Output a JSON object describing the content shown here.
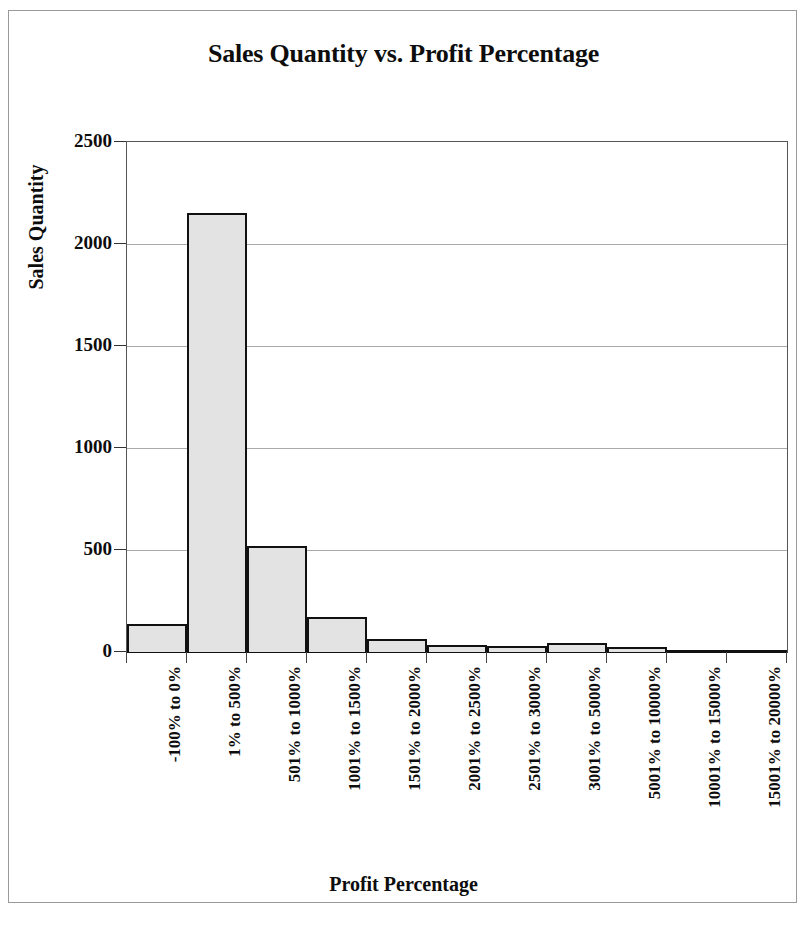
{
  "chart_data": {
    "type": "bar",
    "title": "Sales Quantity vs. Profit Percentage",
    "xlabel": "Profit Percentage",
    "ylabel": "Sales Quantity",
    "categories": [
      "-100% to 0%",
      "1% to 500%",
      "501% to 1000%",
      "1001% to 1500%",
      "1501% to 2000%",
      "2001% to 2500%",
      "2501% to 3000%",
      "3001% to 5000%",
      "5001% to 10000%",
      "10001% to 15000%",
      "15001% to 20000%"
    ],
    "values": [
      135,
      2150,
      520,
      170,
      65,
      35,
      30,
      45,
      25,
      3,
      2
    ],
    "ylim": [
      0,
      2500
    ],
    "yticks": [
      0,
      500,
      1000,
      1500,
      2000,
      2500
    ],
    "ytick_labels": [
      "0",
      "500",
      "1000",
      "1500",
      "2000",
      "2500"
    ],
    "grid": true,
    "legend": "none",
    "bar_fill_color": "#e3e3e3",
    "bar_border_color": "#111111",
    "gridline_color": "#aaaaaa",
    "plot_border_color": "#555555",
    "text_color": "#0d0d0d",
    "background_color": "#ffffff"
  }
}
